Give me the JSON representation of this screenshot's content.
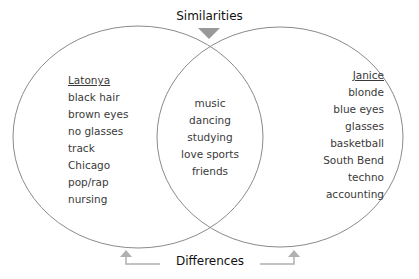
{
  "diagram": {
    "type": "venn",
    "top_label": "Similarities",
    "bottom_label": "Differences",
    "left_set": {
      "title": "Latonya",
      "items": [
        "black hair",
        "brown eyes",
        "no glasses",
        "track",
        "Chicago",
        "pop/rap",
        "nursing"
      ]
    },
    "right_set": {
      "title": "Janice",
      "items": [
        "blonde",
        "blue eyes",
        "glasses",
        "basketball",
        "South Bend",
        "techno",
        "accounting"
      ]
    },
    "intersection": {
      "items": [
        "music",
        "dancing",
        "studying",
        "love sports",
        "friends"
      ]
    },
    "colors": {
      "circle_stroke": "#8a8a8a",
      "arrow": "#a8a8a8",
      "text": "#3a3a3a"
    }
  }
}
